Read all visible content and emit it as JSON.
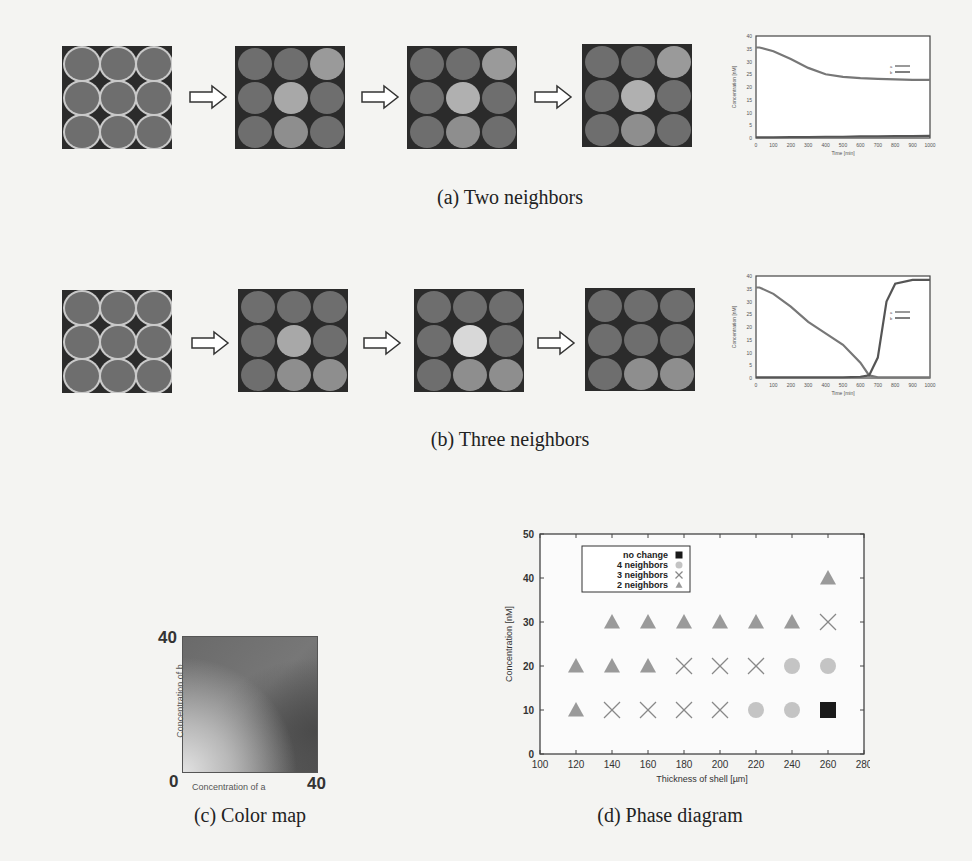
{
  "figure": {
    "row_a": {
      "caption": "(a) Two neighbors",
      "grids": [
        {
          "step": 0,
          "highlight": []
        },
        {
          "step": 1,
          "highlight": [
            [
              0,
              2,
              "#9a9a9a"
            ],
            [
              1,
              1,
              "#a8a8a8"
            ],
            [
              2,
              1,
              "#8e8e8e"
            ]
          ]
        },
        {
          "step": 2,
          "highlight": [
            [
              0,
              2,
              "#9a9a9a"
            ],
            [
              1,
              1,
              "#b0b0b0"
            ],
            [
              2,
              1,
              "#8e8e8e"
            ]
          ]
        },
        {
          "step": 3,
          "highlight": [
            [
              0,
              2,
              "#9a9a9a"
            ],
            [
              1,
              1,
              "#b0b0b0"
            ],
            [
              2,
              1,
              "#8e8e8e"
            ]
          ]
        }
      ],
      "inset_chart": {
        "xlabel": "Time [min]",
        "ylabel": "Concentration [nM]",
        "xticks": [
          "0",
          "100",
          "200",
          "300",
          "400",
          "500",
          "600",
          "700",
          "800",
          "900",
          "1000"
        ],
        "yticks": [
          "0",
          "5",
          "10",
          "15",
          "20",
          "25",
          "30",
          "35",
          "40"
        ],
        "legend": [
          "a",
          "b"
        ]
      }
    },
    "row_b": {
      "caption": "(b) Three neighbors",
      "grids": [
        {
          "step": 0,
          "highlight": []
        },
        {
          "step": 1,
          "highlight": [
            [
              1,
              1,
              "#a8a8a8"
            ],
            [
              2,
              1,
              "#8e8e8e"
            ],
            [
              2,
              2,
              "#8e8e8e"
            ]
          ]
        },
        {
          "step": 2,
          "highlight": [
            [
              1,
              1,
              "#d8d8d8"
            ],
            [
              2,
              1,
              "#8e8e8e"
            ],
            [
              2,
              2,
              "#8e8e8e"
            ]
          ]
        },
        {
          "step": 3,
          "highlight": [
            [
              2,
              1,
              "#8e8e8e"
            ],
            [
              2,
              2,
              "#8e8e8e"
            ]
          ]
        }
      ],
      "inset_chart": {
        "xlabel": "Time [min]",
        "ylabel": "Concentration [nM]",
        "xticks": [
          "0",
          "100",
          "200",
          "300",
          "400",
          "500",
          "600",
          "700",
          "800",
          "900",
          "1000"
        ],
        "yticks": [
          "0",
          "5",
          "10",
          "15",
          "20",
          "25",
          "30",
          "35",
          "40"
        ],
        "legend": [
          "a",
          "b"
        ]
      }
    },
    "color_map": {
      "caption": "(c) Color map",
      "xlabel": "Concentration of a",
      "ylabel": "Concentration of b",
      "x_min": "0",
      "x_max": "40",
      "y_max": "40"
    },
    "phase_diagram": {
      "caption": "(d) Phase diagram"
    }
  },
  "chart_data": [
    {
      "type": "line",
      "title": "(a) Two neighbors inset",
      "xlabel": "Time [min]",
      "ylabel": "Concentration [nM]",
      "xlim": [
        0,
        1000
      ],
      "ylim": [
        0,
        40
      ],
      "x": [
        0,
        20,
        100,
        200,
        300,
        400,
        500,
        600,
        700,
        800,
        900,
        1000
      ],
      "series": [
        {
          "name": "a",
          "values": [
            35.5,
            35.5,
            34,
            31,
            27.5,
            25,
            24,
            23.5,
            23.2,
            23,
            22.8,
            22.8
          ]
        },
        {
          "name": "b",
          "values": [
            0.3,
            0.3,
            0.3,
            0.4,
            0.4,
            0.5,
            0.5,
            0.6,
            0.6,
            0.7,
            0.7,
            0.8
          ]
        }
      ]
    },
    {
      "type": "line",
      "title": "(b) Three neighbors inset",
      "xlabel": "Time [min]",
      "ylabel": "Concentration [nM]",
      "xlim": [
        0,
        1000
      ],
      "ylim": [
        0,
        40
      ],
      "x": [
        0,
        20,
        100,
        200,
        300,
        400,
        500,
        600,
        650,
        700,
        750,
        800,
        900,
        1000
      ],
      "series": [
        {
          "name": "a",
          "values": [
            35.5,
            35.5,
            33,
            28,
            22,
            17.5,
            13,
            6,
            1,
            0.3,
            0.3,
            0.3,
            0.3,
            0.3
          ]
        },
        {
          "name": "b",
          "values": [
            0.3,
            0.3,
            0.3,
            0.3,
            0.3,
            0.3,
            0.3,
            0.5,
            1,
            8,
            30,
            37,
            38.5,
            38.5
          ]
        }
      ]
    },
    {
      "type": "scatter",
      "title": "(d) Phase diagram",
      "xlabel": "Thickness of shell [µm]",
      "ylabel": "Concentration [nM]",
      "xlim": [
        100,
        280
      ],
      "ylim": [
        0,
        50
      ],
      "xticks": [
        "100",
        "120",
        "140",
        "160",
        "180",
        "200",
        "220",
        "240",
        "260",
        "280"
      ],
      "yticks": [
        "0",
        "10",
        "20",
        "30",
        "40",
        "50"
      ],
      "legend_position": "upper-left",
      "legend": [
        {
          "label": "no change",
          "marker": "square",
          "color": "#1a1a1a"
        },
        {
          "label": "4 neighbors",
          "marker": "circle",
          "color": "#c4c4c4"
        },
        {
          "label": "3 neighbors",
          "marker": "x",
          "color": "#888888"
        },
        {
          "label": "2 neighbors",
          "marker": "triangle",
          "color": "#9a9a9a"
        }
      ],
      "points": [
        {
          "x": 120,
          "y": 10,
          "class": "2 neighbors"
        },
        {
          "x": 140,
          "y": 10,
          "class": "3 neighbors"
        },
        {
          "x": 160,
          "y": 10,
          "class": "3 neighbors"
        },
        {
          "x": 180,
          "y": 10,
          "class": "3 neighbors"
        },
        {
          "x": 200,
          "y": 10,
          "class": "3 neighbors"
        },
        {
          "x": 220,
          "y": 10,
          "class": "4 neighbors"
        },
        {
          "x": 240,
          "y": 10,
          "class": "4 neighbors"
        },
        {
          "x": 260,
          "y": 10,
          "class": "no change"
        },
        {
          "x": 120,
          "y": 20,
          "class": "2 neighbors"
        },
        {
          "x": 140,
          "y": 20,
          "class": "2 neighbors"
        },
        {
          "x": 160,
          "y": 20,
          "class": "2 neighbors"
        },
        {
          "x": 180,
          "y": 20,
          "class": "3 neighbors"
        },
        {
          "x": 200,
          "y": 20,
          "class": "3 neighbors"
        },
        {
          "x": 220,
          "y": 20,
          "class": "3 neighbors"
        },
        {
          "x": 240,
          "y": 20,
          "class": "4 neighbors"
        },
        {
          "x": 260,
          "y": 20,
          "class": "4 neighbors"
        },
        {
          "x": 140,
          "y": 30,
          "class": "2 neighbors"
        },
        {
          "x": 160,
          "y": 30,
          "class": "2 neighbors"
        },
        {
          "x": 180,
          "y": 30,
          "class": "2 neighbors"
        },
        {
          "x": 200,
          "y": 30,
          "class": "2 neighbors"
        },
        {
          "x": 220,
          "y": 30,
          "class": "2 neighbors"
        },
        {
          "x": 240,
          "y": 30,
          "class": "2 neighbors"
        },
        {
          "x": 260,
          "y": 30,
          "class": "3 neighbors"
        },
        {
          "x": 260,
          "y": 40,
          "class": "2 neighbors"
        }
      ]
    }
  ]
}
